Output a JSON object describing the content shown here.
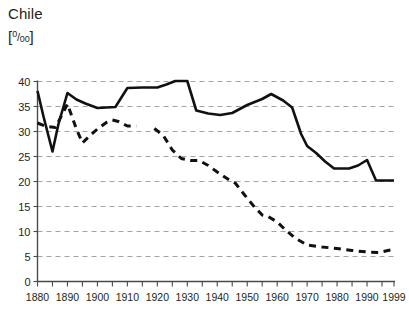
{
  "chart_data": {
    "type": "line",
    "title": "Chile",
    "subtitle": "",
    "ylabel": "[⁰/₀₀]",
    "ylabel_unit_text": "per mille",
    "xlabel": "",
    "xlim": [
      1880,
      1999
    ],
    "ylim": [
      0,
      40
    ],
    "yticks": [
      0,
      5,
      10,
      15,
      20,
      25,
      30,
      35,
      40
    ],
    "ytick_labels": [
      "0",
      "5",
      "10",
      "15",
      "20",
      "25",
      "30",
      "35",
      "40"
    ],
    "xticks": [
      1880,
      1890,
      1900,
      1910,
      1920,
      1930,
      1940,
      1950,
      1960,
      1970,
      1980,
      1990,
      1999
    ],
    "xtick_labels": [
      "1880",
      "1890",
      "1900",
      "1910",
      "1920",
      "1930",
      "1940",
      "1950",
      "1960",
      "1970",
      "1980",
      "1990",
      "1999"
    ],
    "xminor_tick_step": 5,
    "grid": true,
    "grid_axis": "y",
    "grid_style": "dashed",
    "legend": false,
    "legend_position": "none",
    "line_color": "#111111",
    "grid_color": "#9a9a9a",
    "axis_color": "#4a4a4a",
    "series": [
      {
        "name": "birth-rate",
        "style": "solid",
        "points": [
          [
            1880,
            38.1
          ],
          [
            1882,
            33.0
          ],
          [
            1885,
            26.0
          ],
          [
            1887,
            31.5
          ],
          [
            1890,
            37.7
          ],
          [
            1893,
            36.4
          ],
          [
            1896,
            35.6
          ],
          [
            1900,
            34.7
          ],
          [
            1903,
            34.8
          ],
          [
            1906,
            34.9
          ],
          [
            1910,
            38.7
          ],
          [
            1915,
            38.8
          ],
          [
            1920,
            38.8
          ],
          [
            1923,
            39.4
          ],
          [
            1926,
            40.1
          ],
          [
            1930,
            40.1
          ],
          [
            1933,
            34.2
          ],
          [
            1937,
            33.6
          ],
          [
            1941,
            33.3
          ],
          [
            1945,
            33.7
          ],
          [
            1950,
            35.3
          ],
          [
            1955,
            36.5
          ],
          [
            1958,
            37.5
          ],
          [
            1962,
            36.2
          ],
          [
            1965,
            34.8
          ],
          [
            1968,
            29.5
          ],
          [
            1970,
            27.1
          ],
          [
            1973,
            25.7
          ],
          [
            1976,
            24.0
          ],
          [
            1979,
            22.6
          ],
          [
            1984,
            22.6
          ],
          [
            1987,
            23.2
          ],
          [
            1990,
            24.3
          ],
          [
            1993,
            20.2
          ],
          [
            1996,
            20.2
          ],
          [
            1999,
            20.2
          ]
        ]
      },
      {
        "name": "death-rate",
        "style": "dashed",
        "segments": [
          {
            "points": [
              [
                1880,
                31.7
              ],
              [
                1883,
                31.0
              ],
              [
                1886,
                30.8
              ],
              [
                1890,
                35.5
              ],
              [
                1893,
                30.5
              ],
              [
                1895,
                27.7
              ],
              [
                1897,
                28.9
              ],
              [
                1900,
                30.5
              ],
              [
                1903,
                31.8
              ],
              [
                1905,
                32.3
              ],
              [
                1907,
                32.0
              ],
              [
                1910,
                31.1
              ],
              [
                1913,
                31.1
              ]
            ]
          },
          {
            "points": [
              [
                1919,
                30.6
              ],
              [
                1922,
                29.2
              ],
              [
                1925,
                26.3
              ],
              [
                1928,
                24.6
              ],
              [
                1931,
                24.2
              ],
              [
                1934,
                24.2
              ],
              [
                1937,
                23.2
              ],
              [
                1940,
                21.9
              ],
              [
                1944,
                20.3
              ],
              [
                1946,
                19.7
              ],
              [
                1949,
                17.4
              ],
              [
                1952,
                15.2
              ],
              [
                1955,
                13.3
              ],
              [
                1957,
                13.0
              ],
              [
                1960,
                11.9
              ],
              [
                1963,
                10.2
              ],
              [
                1966,
                8.7
              ],
              [
                1970,
                7.3
              ],
              [
                1975,
                6.9
              ],
              [
                1980,
                6.6
              ],
              [
                1985,
                6.2
              ],
              [
                1990,
                5.9
              ],
              [
                1994,
                5.8
              ],
              [
                1997,
                6.2
              ],
              [
                1999,
                6.4
              ]
            ]
          }
        ]
      }
    ]
  }
}
